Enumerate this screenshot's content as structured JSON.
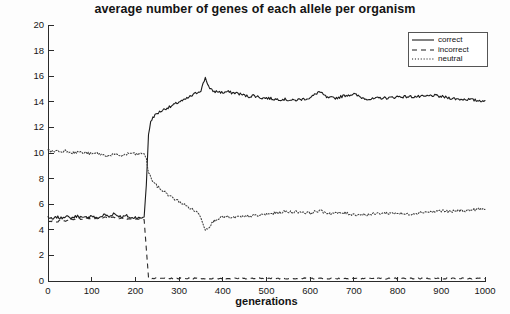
{
  "chart_data": {
    "type": "line",
    "title": "average number of genes of each allele per organism",
    "xlabel": "generations",
    "ylabel": "number of genes",
    "xlim": [
      0,
      1000
    ],
    "ylim": [
      0,
      20
    ],
    "xticks": [
      0,
      100,
      200,
      300,
      400,
      500,
      600,
      700,
      800,
      900,
      1000
    ],
    "yticks": [
      0,
      2,
      4,
      6,
      8,
      10,
      12,
      14,
      16,
      18,
      20
    ],
    "grid": false,
    "legend_position": "top-right",
    "x": [
      0,
      10,
      20,
      30,
      40,
      50,
      60,
      70,
      80,
      90,
      100,
      110,
      120,
      130,
      140,
      150,
      160,
      170,
      180,
      190,
      200,
      210,
      220,
      225,
      230,
      235,
      240,
      250,
      260,
      270,
      280,
      290,
      300,
      310,
      320,
      330,
      340,
      350,
      360,
      370,
      380,
      390,
      400,
      410,
      420,
      430,
      440,
      450,
      460,
      470,
      480,
      490,
      500,
      520,
      540,
      560,
      580,
      600,
      620,
      640,
      660,
      680,
      700,
      720,
      740,
      760,
      780,
      800,
      820,
      840,
      860,
      880,
      900,
      920,
      940,
      960,
      980,
      1000
    ],
    "series": [
      {
        "name": "correct",
        "style": "solid",
        "values": [
          5.0,
          4.8,
          5.0,
          4.9,
          5.1,
          4.9,
          5.0,
          5.1,
          4.9,
          5.0,
          5.1,
          4.9,
          5.0,
          5.2,
          5.0,
          5.3,
          5.1,
          5.0,
          5.1,
          4.9,
          5.0,
          4.9,
          5.0,
          7.5,
          11.5,
          12.4,
          12.8,
          13.1,
          13.3,
          13.5,
          13.6,
          13.8,
          14.0,
          14.1,
          14.3,
          14.5,
          14.7,
          14.9,
          15.9,
          15.0,
          14.8,
          14.8,
          14.7,
          14.8,
          14.7,
          14.7,
          14.6,
          14.5,
          14.4,
          14.5,
          14.4,
          14.3,
          14.3,
          14.2,
          14.2,
          14.1,
          14.2,
          14.3,
          14.8,
          14.3,
          14.3,
          14.5,
          14.6,
          14.3,
          14.2,
          14.3,
          14.3,
          14.4,
          14.4,
          14.4,
          14.4,
          14.5,
          14.4,
          14.3,
          14.2,
          14.2,
          14.1,
          14.1
        ]
      },
      {
        "name": "incorrect",
        "style": "dashed",
        "values": [
          4.6,
          4.7,
          4.6,
          4.8,
          4.7,
          4.9,
          4.8,
          4.9,
          4.8,
          4.9,
          4.8,
          4.9,
          4.9,
          5.0,
          4.9,
          5.0,
          4.9,
          4.9,
          4.8,
          4.9,
          4.8,
          4.9,
          4.8,
          2.5,
          0.3,
          0.2,
          0.2,
          0.2,
          0.2,
          0.2,
          0.2,
          0.2,
          0.2,
          0.2,
          0.2,
          0.2,
          0.2,
          0.2,
          0.2,
          0.2,
          0.2,
          0.2,
          0.2,
          0.2,
          0.2,
          0.2,
          0.2,
          0.2,
          0.2,
          0.2,
          0.2,
          0.2,
          0.2,
          0.2,
          0.2,
          0.2,
          0.2,
          0.2,
          0.2,
          0.2,
          0.2,
          0.2,
          0.2,
          0.2,
          0.2,
          0.2,
          0.2,
          0.2,
          0.2,
          0.2,
          0.2,
          0.2,
          0.2,
          0.2,
          0.2,
          0.2,
          0.2,
          0.2
        ]
      },
      {
        "name": "neutral",
        "style": "dotted",
        "values": [
          10.2,
          10.1,
          10.2,
          10.1,
          10.2,
          10.1,
          10.0,
          10.1,
          10.0,
          10.0,
          9.9,
          10.0,
          9.9,
          9.8,
          9.8,
          9.9,
          9.8,
          9.8,
          9.9,
          10.0,
          9.9,
          9.9,
          10.0,
          9.5,
          8.5,
          8.1,
          7.8,
          7.4,
          7.1,
          6.9,
          6.6,
          6.4,
          6.2,
          6.0,
          5.8,
          5.6,
          5.4,
          5.0,
          4.0,
          4.3,
          4.7,
          4.9,
          5.0,
          5.0,
          4.9,
          5.0,
          5.0,
          5.0,
          5.1,
          5.1,
          5.1,
          5.2,
          5.2,
          5.3,
          5.4,
          5.4,
          5.4,
          5.3,
          5.5,
          5.3,
          5.3,
          5.3,
          5.2,
          5.2,
          5.2,
          5.3,
          5.3,
          5.3,
          5.2,
          5.3,
          5.4,
          5.4,
          5.5,
          5.4,
          5.5,
          5.5,
          5.6,
          5.6
        ]
      }
    ],
    "annotations": [
      "transition at generation ~225 where correct rises sharply and incorrect collapses to zero"
    ]
  },
  "legend": {
    "items": [
      {
        "label": "correct",
        "style": "solid"
      },
      {
        "label": "incorrect",
        "style": "dashed"
      },
      {
        "label": "neutral",
        "style": "dotted"
      }
    ]
  },
  "colors": {
    "ink": "#1c1c1c",
    "background": "#fdfdfd",
    "axis": "#2b2b2b"
  }
}
